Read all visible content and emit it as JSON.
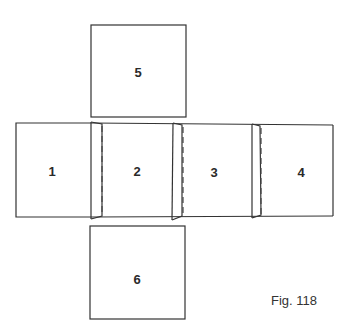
{
  "figure": {
    "caption": "Fig. 118",
    "faces": [
      {
        "id": "1",
        "label": "1"
      },
      {
        "id": "2",
        "label": "2"
      },
      {
        "id": "3",
        "label": "3"
      },
      {
        "id": "4",
        "label": "4"
      },
      {
        "id": "5",
        "label": "5"
      },
      {
        "id": "6",
        "label": "6"
      }
    ],
    "line_color": "#333333"
  }
}
